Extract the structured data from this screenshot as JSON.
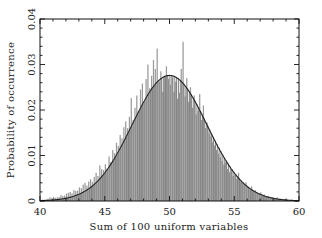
{
  "chart_data": {
    "type": "bar",
    "title": "",
    "xlabel": "Sum of 100 uniform variables",
    "ylabel": "Probability of occurrence",
    "xlim": [
      40,
      60
    ],
    "ylim": [
      0,
      0.04
    ],
    "xticks": [
      40,
      45,
      50,
      55,
      60
    ],
    "xtick_labels": [
      "40",
      "45",
      "50",
      "55",
      "60"
    ],
    "yticks": [
      0,
      0.01,
      0.02,
      0.03,
      0.04
    ],
    "ytick_labels": [
      "0",
      "0.01",
      "0.02",
      "0.03",
      "0.04"
    ],
    "grid": false,
    "legend": null,
    "bin_width": 0.2,
    "bin_start": 40.0,
    "bar_color": "#9a9a9a",
    "bar_edge_color": "#333333",
    "curve_color": "#222222",
    "curve": {
      "type": "gaussian",
      "mean": 50.0,
      "sigma": 2.89,
      "peak": 0.0276
    },
    "histogram_values": [
      0.0002,
      0.0003,
      0.0003,
      0.0004,
      0.0005,
      0.0008,
      0.0006,
      0.0009,
      0.0007,
      0.0008,
      0.0009,
      0.0013,
      0.0011,
      0.0012,
      0.0016,
      0.0018,
      0.002,
      0.0017,
      0.0024,
      0.0022,
      0.0023,
      0.003,
      0.0028,
      0.0036,
      0.004,
      0.0034,
      0.0043,
      0.0048,
      0.0042,
      0.0053,
      0.0062,
      0.0055,
      0.0078,
      0.007,
      0.0068,
      0.0081,
      0.0072,
      0.0098,
      0.0086,
      0.0112,
      0.0105,
      0.0128,
      0.0121,
      0.0145,
      0.0138,
      0.0162,
      0.0175,
      0.016,
      0.0185,
      0.0226,
      0.0178,
      0.0205,
      0.0232,
      0.0196,
      0.0245,
      0.0258,
      0.0218,
      0.0268,
      0.03,
      0.0248,
      0.0275,
      0.031,
      0.029,
      0.0335,
      0.0262,
      0.0285,
      0.024,
      0.0275,
      0.0296,
      0.0268,
      0.0255,
      0.0272,
      0.024,
      0.0262,
      0.0225,
      0.0238,
      0.029,
      0.035,
      0.023,
      0.027,
      0.0218,
      0.025,
      0.0205,
      0.0232,
      0.019,
      0.0198,
      0.0235,
      0.0178,
      0.021,
      0.016,
      0.0172,
      0.0148,
      0.0142,
      0.013,
      0.0122,
      0.0112,
      0.0104,
      0.0096,
      0.0088,
      0.008,
      0.0085,
      0.007,
      0.0063,
      0.0068,
      0.0055,
      0.0058,
      0.0049,
      0.0062,
      0.0043,
      0.004,
      0.0036,
      0.0041,
      0.003,
      0.0026,
      0.0032,
      0.0022,
      0.0024,
      0.0018,
      0.0016,
      0.0019,
      0.0012,
      0.0014,
      0.001,
      0.0011,
      0.0008,
      0.0009,
      0.0007,
      0.0005,
      0.0008,
      0.0004,
      0.0005,
      0.0003,
      0.0004,
      0.0003,
      0.0002,
      0.0002,
      0.0003,
      0.0002,
      0.0001,
      0.0001
    ]
  }
}
